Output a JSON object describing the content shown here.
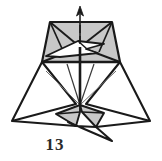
{
  "figure": {
    "kind": "origami-diagram",
    "step_label": "13",
    "background_color": "#ffffff",
    "line_color": "#1a1a1a",
    "shade_color": "#c8c8c8",
    "highlight_color": "#ffffff",
    "thin_line_color": "#555555",
    "label_color": "#2b2b2b"
  },
  "geometry": {
    "top_panel": {
      "name": "upper-trapezoid",
      "fill": "#c8c8c8",
      "points": "50,22 112,22 120,62 42,62"
    },
    "top_panel_creases": [
      {
        "name": "crease-left-diagonal",
        "points": "50,22 80,47"
      },
      {
        "name": "crease-right-diagonal",
        "points": "112,22 80,47"
      },
      {
        "name": "crease-left-lower",
        "points": "42,62 80,47"
      },
      {
        "name": "crease-right-lower",
        "points": "120,62 80,47"
      },
      {
        "name": "crease-left-inner",
        "points": "50,22 62,52"
      },
      {
        "name": "crease-right-inner",
        "points": "112,22 98,52"
      }
    ],
    "white_flap": {
      "name": "white-arrow-flap",
      "fill": "#ffffff",
      "points": "46,56 78,41 104,44 86,49 98,53 60,57"
    },
    "white_flap_inner": {
      "name": "white-flap-inner-crease",
      "points": "78,41 86,49"
    },
    "arrow": {
      "name": "fold-direction-arrow",
      "shaft": "80,40 80,12",
      "head": "80,6 76,16 84,16",
      "dashes": [
        "80,36 80,30",
        "80,27 80,21",
        "80,19 80,14"
      ]
    },
    "center_spine": {
      "name": "center-vertical-spine",
      "points": "80,47 80,105"
    },
    "left_wing": {
      "name": "left-wing-flap",
      "points": "42,62 12,121 76,104"
    },
    "right_wing": {
      "name": "right-wing-flap",
      "points": "120,62 150,121 86,104"
    },
    "lower_shade_left": {
      "name": "lower-shaded-left-panel",
      "fill": "#c8c8c8",
      "points": "80,105 56,114 76,126 80,112"
    },
    "lower_shade_right": {
      "name": "lower-shaded-right-panel",
      "fill": "#c8c8c8",
      "points": "80,105 104,113 96,127 82,112"
    },
    "lower_tail_left": {
      "name": "lower-tail-left",
      "points": "12,121 76,126 80,112"
    },
    "lower_tail_right": {
      "name": "lower-tail-right",
      "points": "150,121 96,127 82,112"
    },
    "bottom_point": {
      "name": "bottom-point-flap",
      "points": "76,126 68,122 112,141 96,127"
    },
    "thin_creases": [
      {
        "name": "thin-crease-left",
        "points": "46,70 80,105"
      },
      {
        "name": "thin-crease-right",
        "points": "116,70 80,105"
      },
      {
        "name": "thin-crease-left-inner",
        "points": "66,64 80,105"
      },
      {
        "name": "thin-crease-right-inner",
        "points": "96,64 80,105"
      }
    ]
  }
}
